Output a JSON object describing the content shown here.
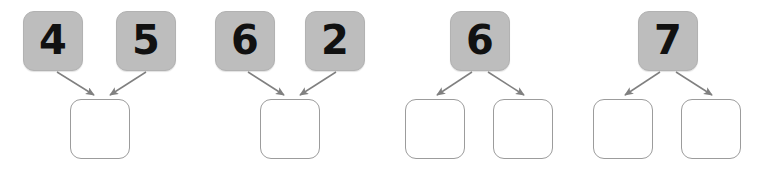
{
  "page": {
    "background_color": "#ffffff",
    "filled_box_color": "#bdbdbd",
    "empty_box_border_color": "#9c9c9c",
    "arrow_color": "#808080",
    "digit_color": "#111111"
  },
  "groups": [
    {
      "id": "group-1",
      "type": "parts-to-whole",
      "left": 0,
      "top_boxes": [
        {
          "value": "4",
          "filled": true,
          "x": 23,
          "y": 11
        },
        {
          "value": "5",
          "filled": true,
          "x": 116,
          "y": 11
        }
      ],
      "bottom_boxes": [
        {
          "value": "",
          "filled": false,
          "x": 70,
          "y": 99
        }
      ],
      "arrows": [
        {
          "x1": 57,
          "y1": 72,
          "x2": 94,
          "y2": 95
        },
        {
          "x1": 146,
          "y1": 72,
          "x2": 110,
          "y2": 95
        }
      ]
    },
    {
      "id": "group-2",
      "type": "parts-to-whole",
      "left": 0,
      "top_boxes": [
        {
          "value": "6",
          "filled": true,
          "x": 215,
          "y": 11
        },
        {
          "value": "2",
          "filled": true,
          "x": 305,
          "y": 11
        }
      ],
      "bottom_boxes": [
        {
          "value": "",
          "filled": false,
          "x": 260,
          "y": 99
        }
      ],
      "arrows": [
        {
          "x1": 248,
          "y1": 72,
          "x2": 284,
          "y2": 95
        },
        {
          "x1": 336,
          "y1": 72,
          "x2": 300,
          "y2": 95
        }
      ]
    },
    {
      "id": "group-3",
      "type": "whole-to-parts",
      "left": 0,
      "top_boxes": [
        {
          "value": "6",
          "filled": true,
          "x": 450,
          "y": 11
        }
      ],
      "bottom_boxes": [
        {
          "value": "",
          "filled": false,
          "x": 405,
          "y": 99
        },
        {
          "value": "",
          "filled": false,
          "x": 493,
          "y": 99
        }
      ],
      "arrows": [
        {
          "x1": 472,
          "y1": 72,
          "x2": 437,
          "y2": 95
        },
        {
          "x1": 488,
          "y1": 72,
          "x2": 524,
          "y2": 95
        }
      ]
    },
    {
      "id": "group-4",
      "type": "whole-to-parts",
      "left": 0,
      "top_boxes": [
        {
          "value": "7",
          "filled": true,
          "x": 638,
          "y": 11
        }
      ],
      "bottom_boxes": [
        {
          "value": "",
          "filled": false,
          "x": 593,
          "y": 99
        },
        {
          "value": "",
          "filled": false,
          "x": 681,
          "y": 99
        }
      ],
      "arrows": [
        {
          "x1": 660,
          "y1": 72,
          "x2": 625,
          "y2": 95
        },
        {
          "x1": 676,
          "y1": 72,
          "x2": 712,
          "y2": 95
        }
      ]
    }
  ]
}
